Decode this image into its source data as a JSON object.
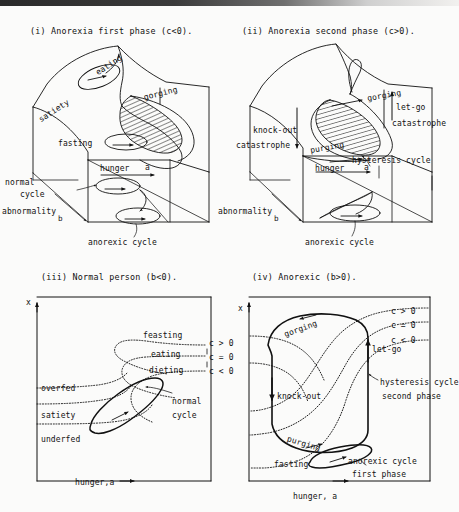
{
  "figure": {
    "title_hidden": "",
    "background_color": "#fbfbfa",
    "ink_color": "#111111"
  },
  "panels": [
    {
      "id": "panel-i",
      "caption": "(i) Anorexia first phase (c<0).",
      "type": "3d-cusp-surface",
      "labels": [
        {
          "name": "eating",
          "text": "eating"
        },
        {
          "name": "satiety",
          "text": "satiety"
        },
        {
          "name": "gorging",
          "text": "gorging"
        },
        {
          "name": "fasting",
          "text": "fasting"
        },
        {
          "name": "hunger-axis",
          "text": "hunger"
        },
        {
          "name": "hunger-axis-a",
          "text": "a"
        },
        {
          "name": "normal-cycle",
          "text": "normal"
        },
        {
          "name": "normal-cycle2",
          "text": "cycle"
        },
        {
          "name": "abnormality",
          "text": "abnormality"
        },
        {
          "name": "abnormality-b",
          "text": "b"
        },
        {
          "name": "anorexic-cycle",
          "text": "anorexic cycle"
        }
      ]
    },
    {
      "id": "panel-ii",
      "caption": "(ii) Anorexia second phase (c>0).",
      "type": "3d-cusp-surface",
      "labels": [
        {
          "name": "gorging",
          "text": "gorging"
        },
        {
          "name": "let-go",
          "text": "let-go"
        },
        {
          "name": "catastrophe-right",
          "text": "catastrophe"
        },
        {
          "name": "knock-out",
          "text": "knock-out"
        },
        {
          "name": "catastrophe-left",
          "text": "catastrophe"
        },
        {
          "name": "purging",
          "text": "purging"
        },
        {
          "name": "hysteresis-cycle",
          "text": "hysteresis cycle"
        },
        {
          "name": "hunger-axis",
          "text": "hunger"
        },
        {
          "name": "hunger-axis-a",
          "text": "a"
        },
        {
          "name": "abnormality",
          "text": "abnormality"
        },
        {
          "name": "abnormality-b",
          "text": "b"
        },
        {
          "name": "anorexic-cycle",
          "text": "anorexic cycle"
        }
      ]
    },
    {
      "id": "panel-iii",
      "caption": "(iii) Normal person (b<0).",
      "type": "2d-phase-portrait",
      "axes": {
        "y": "x",
        "x": "hunger,a"
      },
      "labels": [
        {
          "name": "feasting",
          "text": "feasting"
        },
        {
          "name": "eating",
          "text": "eating"
        },
        {
          "name": "dieting",
          "text": "dieting"
        },
        {
          "name": "c-gt-0",
          "text": "c > 0"
        },
        {
          "name": "c-eq-0",
          "text": "c = 0"
        },
        {
          "name": "c-lt-0",
          "text": "c < 0"
        },
        {
          "name": "overfed",
          "text": "overfed"
        },
        {
          "name": "satiety",
          "text": "satiety"
        },
        {
          "name": "underfed",
          "text": "underfed"
        },
        {
          "name": "normal",
          "text": "normal"
        },
        {
          "name": "cycle",
          "text": "cycle"
        }
      ]
    },
    {
      "id": "panel-iv",
      "caption": "(iv) Anorexic (b>0).",
      "type": "2d-phase-portrait",
      "axes": {
        "y": "x",
        "x": "hunger, a"
      },
      "labels": [
        {
          "name": "gorging",
          "text": "gorging"
        },
        {
          "name": "let-go",
          "text": "let-go"
        },
        {
          "name": "c-gt-0",
          "text": "c > 0"
        },
        {
          "name": "c-eq-0",
          "text": "c = 0"
        },
        {
          "name": "c-lt-0",
          "text": "c < 0"
        },
        {
          "name": "hysteresis-1",
          "text": "hysteresis cycle"
        },
        {
          "name": "hysteresis-2",
          "text": "second phase"
        },
        {
          "name": "knock-out",
          "text": "knock-out"
        },
        {
          "name": "purging",
          "text": "purging"
        },
        {
          "name": "fasting",
          "text": "fasting"
        },
        {
          "name": "anorexic-1",
          "text": "anorexic cycle"
        },
        {
          "name": "anorexic-2",
          "text": "first phase"
        }
      ]
    }
  ],
  "panel_i": {
    "caption": "(i) Anorexia first phase (c<0).",
    "eating": "eating",
    "satiety": "satiety",
    "gorging": "gorging",
    "fasting": "fasting",
    "hunger": "hunger",
    "a": "a",
    "normal": "normal",
    "cycle": "cycle",
    "abnormality": "abnormality",
    "b": "b",
    "anorexic_cycle": "anorexic cycle"
  },
  "panel_ii": {
    "caption": "(ii) Anorexia second phase (c>0).",
    "gorging": "gorging",
    "let_go": "let-go",
    "catastrophe_right": "catastrophe",
    "knock_out": "knock-out",
    "catastrophe_left": "catastrophe",
    "purging": "purging",
    "hysteresis_cycle": "hysteresis cycle",
    "hunger": "hunger",
    "a": "a",
    "abnormality": "abnormality",
    "b": "b",
    "anorexic_cycle": "anorexic cycle"
  },
  "panel_iii": {
    "caption": "(iii) Normal person (b<0).",
    "x_axis_label": "x",
    "bottom_axis_label": "hunger,a",
    "feasting": "feasting",
    "eating": "eating",
    "dieting": "dieting",
    "c_gt": "c > 0",
    "c_eq": "c = 0",
    "c_lt": "c < 0",
    "overfed": "overfed",
    "satiety": "satiety",
    "underfed": "underfed",
    "normal": "normal",
    "cycle": "cycle"
  },
  "panel_iv": {
    "caption": "(iv) Anorexic (b>0).",
    "x_axis_label": "x",
    "bottom_axis_label": "hunger, a",
    "gorging": "gorging",
    "let_go": "let-go",
    "c_gt": "c > 0",
    "c_eq": "c = 0",
    "c_lt": "c < 0",
    "hysteresis_1": "hysteresis cycle",
    "hysteresis_2": "second phase",
    "knock_out": "knock-out",
    "purging": "purging",
    "fasting": "fasting",
    "anorexic_1": "anorexic cycle",
    "anorexic_2": "first phase"
  }
}
